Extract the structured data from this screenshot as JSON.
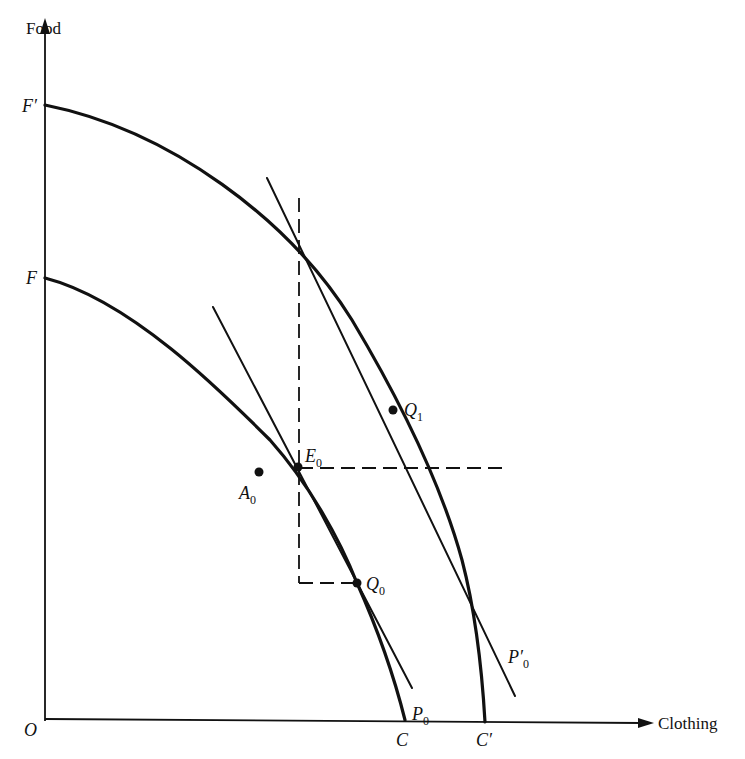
{
  "figure": {
    "axes": {
      "y_label": "Food",
      "x_label": "Clothing",
      "origin_label": "O"
    },
    "curves": [
      {
        "name": "original-ppf",
        "start_label": "F",
        "end_label": "C"
      },
      {
        "name": "expanded-ppf",
        "start_label": "F'",
        "end_label": "C'"
      }
    ],
    "price_lines": [
      {
        "name": "P0",
        "label_main": "P",
        "label_sub": "0"
      },
      {
        "name": "P0-prime",
        "label_main": "P′",
        "label_sub": "0"
      }
    ],
    "points": [
      {
        "id": "A0",
        "label_main": "A",
        "label_sub": "0"
      },
      {
        "id": "E0",
        "label_main": "E",
        "label_sub": "0"
      },
      {
        "id": "Q0",
        "label_main": "Q",
        "label_sub": "0"
      },
      {
        "id": "Q1",
        "label_main": "Q",
        "label_sub": "1"
      }
    ],
    "labels": {
      "F": "F",
      "F_prime": "F′",
      "C": "C",
      "C_prime": "C′"
    }
  }
}
